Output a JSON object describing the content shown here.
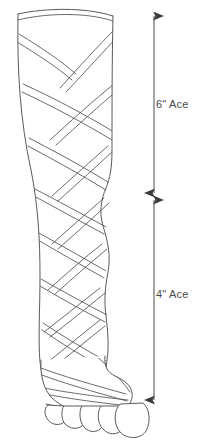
{
  "figure": {
    "background_color": "#ffffff",
    "line_color": "#5a5a5a",
    "text_color": "#4a4a4a",
    "fill_color": "#ffffff"
  },
  "dimensions": [
    {
      "id": "upper",
      "label": "6\" Ace",
      "size": "6\"",
      "material": "Ace",
      "region": "thigh-to-knee",
      "arrow_style": "double-headed",
      "arrow_top_y": 16,
      "arrow_bottom_y": 193,
      "arrow_x": 154,
      "label_x": 156,
      "label_y": 98
    },
    {
      "id": "lower",
      "label": "4\" Ace",
      "size": "4\"",
      "material": "Ace",
      "region": "calf-to-foot",
      "arrow_style": "double-headed",
      "arrow_top_y": 200,
      "arrow_bottom_y": 400,
      "arrow_x": 154,
      "label_x": 156,
      "label_y": 288
    }
  ],
  "leg": {
    "outline_left_top_x": 18,
    "outline_right_top_x": 113,
    "top_y": 12,
    "foot_y": 398,
    "toes_count": 5
  },
  "wrap": {
    "style": "spiral-figure-eight",
    "strand_type": "double-line",
    "wrap_band_count": 14
  }
}
